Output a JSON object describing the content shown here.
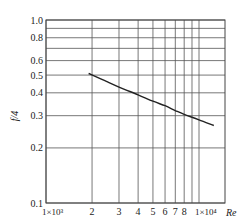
{
  "chart_data": {
    "type": "line",
    "title": "",
    "xlabel": "Re",
    "ylabel": "f/4",
    "xscale": "log",
    "yscale": "log",
    "xlim": [
      1000,
      15000
    ],
    "ylim": [
      0.1,
      1.0
    ],
    "grid": true,
    "legend": null,
    "x_ticks": [
      {
        "value": 1000,
        "label": "1×10³"
      },
      {
        "value": 2000,
        "label": "2"
      },
      {
        "value": 3000,
        "label": "3"
      },
      {
        "value": 4000,
        "label": "4"
      },
      {
        "value": 5000,
        "label": "5"
      },
      {
        "value": 6000,
        "label": "6"
      },
      {
        "value": 7000,
        "label": "7"
      },
      {
        "value": 8000,
        "label": "8"
      },
      {
        "value": 9000,
        "label": ""
      },
      {
        "value": 10000,
        "label": "1×10⁴"
      }
    ],
    "y_ticks": [
      {
        "value": 1.0,
        "label": "1.0"
      },
      {
        "value": 0.9,
        "label": ""
      },
      {
        "value": 0.8,
        "label": "0.8"
      },
      {
        "value": 0.7,
        "label": ""
      },
      {
        "value": 0.6,
        "label": "0.6"
      },
      {
        "value": 0.5,
        "label": "0.5"
      },
      {
        "value": 0.4,
        "label": "0.4"
      },
      {
        "value": 0.3,
        "label": "0.3"
      },
      {
        "value": 0.2,
        "label": "0.2"
      },
      {
        "value": 0.1,
        "label": "0.1"
      }
    ],
    "series": [
      {
        "name": "f/4 vs Re",
        "x": [
          1900,
          2500,
          3000,
          4000,
          5000,
          6000,
          7000,
          8000,
          10000,
          12500
        ],
        "y": [
          0.51,
          0.46,
          0.43,
          0.39,
          0.36,
          0.34,
          0.32,
          0.305,
          0.285,
          0.265
        ]
      }
    ]
  }
}
